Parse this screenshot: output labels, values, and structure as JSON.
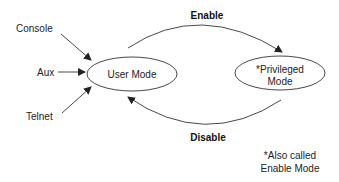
{
  "diagram": {
    "inputs": [
      {
        "label": "Console"
      },
      {
        "label": "Aux"
      },
      {
        "label": "Telnet"
      }
    ],
    "nodes": {
      "user_mode": {
        "label": "User Mode"
      },
      "privileged_mode": {
        "line1": "*Privileged",
        "line2": "Mode"
      }
    },
    "edges": {
      "enable": {
        "label": "Enable"
      },
      "disable": {
        "label": "Disable"
      }
    },
    "footnote": {
      "line1": "*Also called",
      "line2": "Enable Mode"
    },
    "colors": {
      "stroke": "#333333",
      "text": "#222222",
      "background": "#ffffff"
    }
  }
}
